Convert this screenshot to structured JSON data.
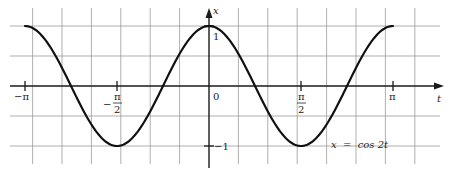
{
  "chart_data": {
    "type": "line",
    "title": "",
    "equation_label": "x = cos 2t",
    "xlabel": "t",
    "ylabel": "x",
    "xlim": [
      -3.5,
      3.6
    ],
    "ylim": [
      -1.25,
      1.25
    ],
    "x_ticks": [
      {
        "value": -3.14159,
        "label_num": "π",
        "label_den": "",
        "sign": "−"
      },
      {
        "value": -1.5708,
        "label_num": "π",
        "label_den": "2",
        "sign": "−"
      },
      {
        "value": 0,
        "label_num": "0",
        "label_den": "",
        "sign": ""
      },
      {
        "value": 1.5708,
        "label_num": "π",
        "label_den": "2",
        "sign": ""
      },
      {
        "value": 3.14159,
        "label_num": "π",
        "label_den": "",
        "sign": ""
      }
    ],
    "y_ticks": [
      {
        "value": 1,
        "label": "1"
      },
      {
        "value": -1,
        "label": "−1"
      }
    ],
    "grid": true,
    "series": [
      {
        "name": "x = cos 2t",
        "function": "cos(2t)",
        "domain": [
          -3.14159,
          3.14159
        ],
        "points": [
          {
            "t": -3.14159,
            "x": 1
          },
          {
            "t": -2.35619,
            "x": 0
          },
          {
            "t": -1.5708,
            "x": -1
          },
          {
            "t": -0.7854,
            "x": 0
          },
          {
            "t": 0,
            "x": 1
          },
          {
            "t": 0.7854,
            "x": 0
          },
          {
            "t": 1.5708,
            "x": -1
          },
          {
            "t": 2.35619,
            "x": 0
          },
          {
            "t": 3.14159,
            "x": 1
          }
        ]
      }
    ]
  },
  "labels": {
    "x_axis": "t",
    "y_axis": "x",
    "origin": "0",
    "y_pos_one": "1",
    "y_neg_one": "−1",
    "neg_pi": "−π",
    "neg_pi_over_2_sign": "−",
    "pi_over_2_num": "π",
    "pi_over_2_den": "2",
    "pi": "π",
    "curve_label": "x  =  cos 2t"
  }
}
